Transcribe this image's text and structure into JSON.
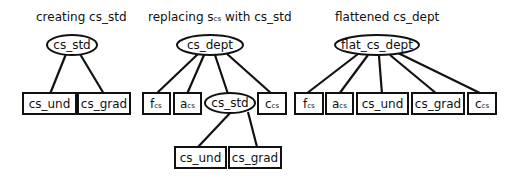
{
  "panels": [
    {
      "title": "creating cs_std",
      "root": "cs_std",
      "children": [
        "cs_und",
        "cs_grad"
      ]
    },
    {
      "title_prefix": "replacing ",
      "title_sym": "s",
      "title_sub": "cs",
      "title_suffix": " with cs_std",
      "root": "cs_dept",
      "children": [
        {
          "base": "f",
          "sub": "cs"
        },
        {
          "base": "a",
          "sub": "cs"
        },
        {
          "label": "cs_std",
          "children": [
            "cs_und",
            "cs_grad"
          ]
        },
        {
          "base": "c",
          "sub": "cs"
        }
      ]
    },
    {
      "title": "flattened cs_dept",
      "root": "flat_cs_dept",
      "children": [
        {
          "base": "f",
          "sub": "cs"
        },
        {
          "base": "a",
          "sub": "cs"
        },
        {
          "label": "cs_und"
        },
        {
          "label": "cs_grad"
        },
        {
          "base": "c",
          "sub": "cs"
        }
      ]
    }
  ]
}
